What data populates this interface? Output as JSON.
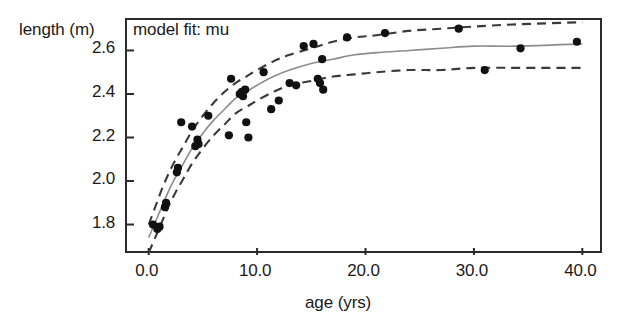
{
  "figure": {
    "panel_title": "model fit: mu",
    "y_axis_label": "length (m)",
    "x_axis_label": "age (yrs)",
    "frame_color": "#2b2b2b",
    "point_color": "#111111",
    "fit_color": "#8c8c8c",
    "band_color": "#3a3a3a",
    "background": "#ffffff"
  },
  "chart_data": {
    "type": "scatter",
    "title": "model fit: mu",
    "xlabel": "age (yrs)",
    "ylabel": "length (m)",
    "xlim": [
      -2.0,
      42.0
    ],
    "ylim": [
      1.66,
      2.74
    ],
    "grid": false,
    "legend": null,
    "xticks": [
      0.0,
      10.0,
      20.0,
      30.0,
      40.0
    ],
    "xtick_labels": [
      "0.0",
      "10.0",
      "20.0",
      "30.0",
      "40.0"
    ],
    "yticks": [
      1.8,
      2.0,
      2.2,
      2.4,
      2.6
    ],
    "ytick_labels": [
      "1.8",
      "2.0",
      "2.2",
      "2.4",
      "2.6"
    ],
    "points": [
      {
        "x": 0.4,
        "y": 1.8
      },
      {
        "x": 0.8,
        "y": 1.78
      },
      {
        "x": 1.0,
        "y": 1.79
      },
      {
        "x": 1.5,
        "y": 1.88
      },
      {
        "x": 1.6,
        "y": 1.9
      },
      {
        "x": 2.6,
        "y": 2.04
      },
      {
        "x": 2.7,
        "y": 2.06
      },
      {
        "x": 3.0,
        "y": 2.27
      },
      {
        "x": 4.0,
        "y": 2.25
      },
      {
        "x": 4.3,
        "y": 2.16
      },
      {
        "x": 4.5,
        "y": 2.19
      },
      {
        "x": 4.6,
        "y": 2.17
      },
      {
        "x": 5.5,
        "y": 2.3
      },
      {
        "x": 7.4,
        "y": 2.21
      },
      {
        "x": 7.6,
        "y": 2.47
      },
      {
        "x": 8.4,
        "y": 2.4
      },
      {
        "x": 8.6,
        "y": 2.41
      },
      {
        "x": 8.7,
        "y": 2.39
      },
      {
        "x": 8.9,
        "y": 2.42
      },
      {
        "x": 9.0,
        "y": 2.27
      },
      {
        "x": 9.2,
        "y": 2.2
      },
      {
        "x": 10.6,
        "y": 2.5
      },
      {
        "x": 11.3,
        "y": 2.33
      },
      {
        "x": 12.0,
        "y": 2.37
      },
      {
        "x": 13.0,
        "y": 2.45
      },
      {
        "x": 13.6,
        "y": 2.44
      },
      {
        "x": 14.3,
        "y": 2.62
      },
      {
        "x": 15.2,
        "y": 2.63
      },
      {
        "x": 15.6,
        "y": 2.47
      },
      {
        "x": 15.8,
        "y": 2.45
      },
      {
        "x": 16.0,
        "y": 2.56
      },
      {
        "x": 16.1,
        "y": 2.42
      },
      {
        "x": 18.3,
        "y": 2.66
      },
      {
        "x": 21.8,
        "y": 2.68
      },
      {
        "x": 28.6,
        "y": 2.7
      },
      {
        "x": 31.0,
        "y": 2.51
      },
      {
        "x": 34.3,
        "y": 2.61
      },
      {
        "x": 39.5,
        "y": 2.64
      }
    ],
    "series": [
      {
        "name": "model fit (mu)",
        "style": "solid",
        "color": "#8c8c8c",
        "x": [
          0.0,
          0.6,
          1.2,
          1.8,
          2.5,
          3.2,
          4.0,
          5.0,
          6.0,
          7.0,
          8.0,
          9.0,
          10.0,
          11.5,
          13.0,
          15.0,
          17.0,
          19.0,
          21.0,
          24.0,
          27.0,
          30.0,
          34.0,
          40.0
        ],
        "y": [
          1.74,
          1.81,
          1.88,
          1.95,
          2.02,
          2.08,
          2.15,
          2.22,
          2.28,
          2.33,
          2.38,
          2.41,
          2.44,
          2.48,
          2.51,
          2.54,
          2.56,
          2.58,
          2.59,
          2.6,
          2.61,
          2.62,
          2.62,
          2.63
        ]
      },
      {
        "name": "upper confidence band",
        "style": "dashed",
        "color": "#3a3a3a",
        "x": [
          0.0,
          0.6,
          1.2,
          1.8,
          2.5,
          3.2,
          4.0,
          5.0,
          6.0,
          7.0,
          8.0,
          9.0,
          10.0,
          11.5,
          13.0,
          15.0,
          17.0,
          19.0,
          21.0,
          24.0,
          27.0,
          30.0,
          34.0,
          40.0
        ],
        "y": [
          1.8,
          1.88,
          1.96,
          2.03,
          2.1,
          2.16,
          2.23,
          2.3,
          2.36,
          2.41,
          2.45,
          2.48,
          2.51,
          2.55,
          2.58,
          2.61,
          2.64,
          2.66,
          2.67,
          2.69,
          2.7,
          2.71,
          2.72,
          2.73
        ]
      },
      {
        "name": "lower confidence band",
        "style": "dashed",
        "color": "#3a3a3a",
        "x": [
          0.0,
          0.6,
          1.2,
          1.8,
          2.5,
          3.2,
          4.0,
          5.0,
          6.0,
          7.0,
          8.0,
          9.0,
          10.0,
          11.5,
          13.0,
          15.0,
          17.0,
          19.0,
          21.0,
          24.0,
          27.0,
          30.0,
          34.0,
          40.0
        ],
        "y": [
          1.67,
          1.74,
          1.81,
          1.88,
          1.95,
          2.01,
          2.08,
          2.15,
          2.21,
          2.26,
          2.31,
          2.34,
          2.37,
          2.41,
          2.44,
          2.46,
          2.48,
          2.49,
          2.5,
          2.51,
          2.51,
          2.52,
          2.52,
          2.52
        ]
      }
    ]
  }
}
